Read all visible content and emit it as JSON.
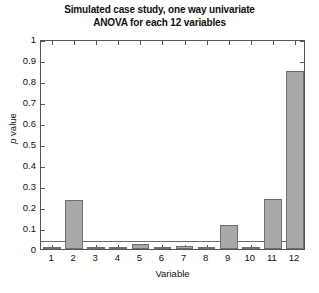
{
  "chart_data": {
    "type": "bar",
    "title": "Simulated case study, one way univariate ANOVA for each 12 variables",
    "title_lines": [
      "Simulated case study, one way univariate",
      "ANOVA for each 12 variables"
    ],
    "xlabel": "Variable",
    "ylabel": "p value",
    "ylabel_italic_part": "p",
    "ylabel_rest": " value",
    "categories": [
      "1",
      "2",
      "3",
      "4",
      "5",
      "6",
      "7",
      "8",
      "9",
      "10",
      "11",
      "12"
    ],
    "values": [
      0.005,
      0.235,
      0.005,
      0.002,
      0.025,
      0.005,
      0.012,
      0.002,
      0.115,
      0.004,
      0.24,
      0.85
    ],
    "ylim": [
      0,
      1
    ],
    "xlim": [
      0.5,
      12.5
    ],
    "ytick_labels": [
      "0",
      "0.1",
      "0.2",
      "0.3",
      "0.4",
      "0.5",
      "0.6",
      "0.7",
      "0.8",
      "0.9",
      "1"
    ],
    "ytick_values": [
      0,
      0.1,
      0.2,
      0.3,
      0.4,
      0.5,
      0.6,
      0.7,
      0.8,
      0.9,
      1
    ],
    "grid": false,
    "legend": null,
    "bar_color": "#a9a9a9",
    "bar_edge_color": "#6e6e6e",
    "axis_color": "#555555",
    "threshold": {
      "value": 0.05,
      "label": "significance threshold",
      "color": "#6b6b6b"
    }
  }
}
